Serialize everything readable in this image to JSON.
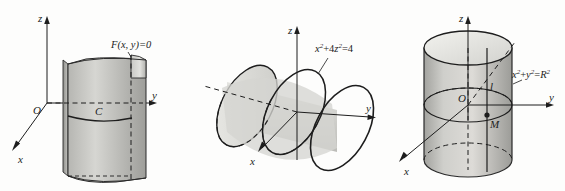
{
  "page": {
    "background_color": "#fdfdfc",
    "ink_color": "#1d1d1d",
    "surface_fill_light": "#d8d8d4",
    "surface_fill_mid": "#c2c2be",
    "surface_fill_dark": "#a9a9a5"
  },
  "figures": [
    {
      "id": "fig-1",
      "caption": "cylindrical surface with generating curve in the xOy plane",
      "axes": {
        "z_label": "z",
        "y_label": "y",
        "x_label": "x",
        "origin_label": "O"
      },
      "labels": {
        "equation": "F(x, y)=0",
        "curve_label": "C"
      }
    },
    {
      "id": "fig-2",
      "caption": "elliptic cylinder about the y axis",
      "axes": {
        "z_label": "z",
        "y_label": "y",
        "x_label": "x"
      },
      "labels": {
        "equation_base": "x",
        "equation_full": "x²+4z²=4",
        "eq_term1": "x",
        "eq_sup1": "2",
        "eq_plus": "+4",
        "eq_term2": "z",
        "eq_sup2": "2",
        "eq_rhs": "=4"
      }
    },
    {
      "id": "fig-3",
      "caption": "circular cylinder of radius R about the z axis",
      "axes": {
        "z_label": "z",
        "y_label": "y",
        "x_label": "x",
        "origin_label": "O"
      },
      "labels": {
        "equation_full": "x²+y²=R²",
        "eq_term1": "x",
        "eq_sup1": "2",
        "eq_plus": "+",
        "eq_term2": "y",
        "eq_sup2": "2",
        "eq_eq": "=",
        "eq_term3": "R",
        "eq_sup3": "2",
        "generator_label": "l",
        "point_label": "M"
      }
    }
  ]
}
